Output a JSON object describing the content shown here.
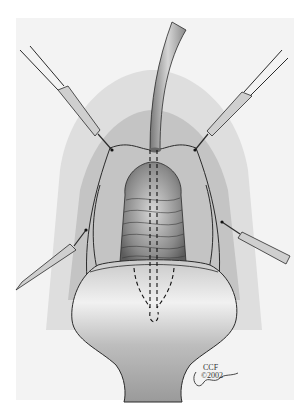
{
  "illustration": {
    "subject": "surgical illustration with retractor hooks, central catheter and dashed incision lines",
    "palette": {
      "background": "#ffffff",
      "frame": "#f3f3f3",
      "tissue_dark": "#6f6f6f",
      "tissue_mid": "#b5b5b5",
      "tissue_light": "#e6e6e6",
      "line": "#2a2a2a"
    },
    "credit": {
      "line1": "CCF",
      "line2": "©2002",
      "signature": "Pazgoca"
    }
  }
}
